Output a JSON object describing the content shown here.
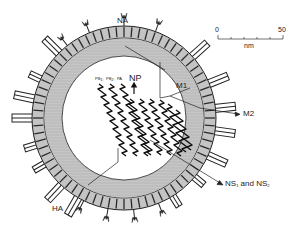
{
  "diagram": {
    "colors": {
      "background": "#ffffff",
      "ink": "#222222",
      "matrix_gray": "#b8b8b8",
      "envelope_gray": "#c8c8c8",
      "stripe_dark": "#333333",
      "spike_fill": "#ffffff"
    },
    "labels": {
      "na": "NA",
      "np": "NP",
      "np_arrow": "↑",
      "polymerase": "PB₁ PB₂ PA",
      "pb1": "PB",
      "pb1_sub": "1",
      "pb2": "PB",
      "pb2_sub": "2",
      "pa": "PA",
      "m1": "M1",
      "m2": "M2",
      "ha": "HA",
      "ns_prefix": "NS",
      "ns1_sub": "1",
      "ns_and": " and NS",
      "ns2_sub": "2"
    },
    "scale_bar": {
      "min_label": "0",
      "max_label": "50",
      "unit": "nm",
      "ticks": 6
    },
    "components": [
      {
        "name": "HA",
        "type": "rectangular spikes around envelope"
      },
      {
        "name": "NA",
        "type": "mushroom-shaped spikes"
      },
      {
        "name": "M1",
        "type": "matrix layer"
      },
      {
        "name": "M2",
        "type": "ion channel in envelope"
      },
      {
        "name": "NP",
        "type": "nucleoprotein with RNA segments"
      },
      {
        "name": "PB1, PB2, PA",
        "type": "polymerase complex"
      },
      {
        "name": "NS1 and NS2",
        "type": "nonstructural proteins"
      }
    ]
  }
}
